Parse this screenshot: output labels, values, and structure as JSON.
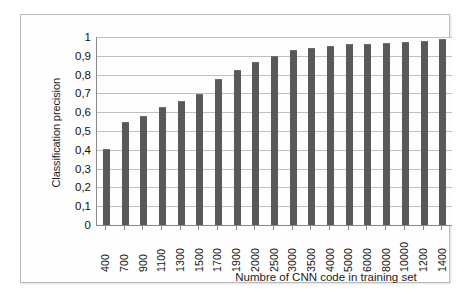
{
  "chart_data": {
    "type": "bar",
    "title": "",
    "xlabel": "Numbre of CNN code in training set",
    "ylabel": "Classification precision",
    "categories": [
      "400",
      "700",
      "900",
      "1100",
      "1300",
      "1500",
      "1700",
      "1900",
      "2000",
      "2500",
      "3000",
      "3500",
      "4000",
      "5000",
      "6000",
      "8000",
      "10000",
      "1200",
      "1400"
    ],
    "values": [
      0.4,
      0.54,
      0.575,
      0.625,
      0.655,
      0.69,
      0.77,
      0.82,
      0.86,
      0.895,
      0.925,
      0.935,
      0.945,
      0.955,
      0.96,
      0.965,
      0.97,
      0.975,
      0.985
    ],
    "ylim": [
      0,
      1
    ],
    "ytick_labels": [
      "0",
      "0,1",
      "0,2",
      "0,3",
      "0,4",
      "0,5",
      "0,6",
      "0,7",
      "0,8",
      "0,9",
      "1"
    ],
    "ytick_values": [
      0,
      0.1,
      0.2,
      0.3,
      0.4,
      0.5,
      0.6,
      0.7,
      0.8,
      0.9,
      1
    ],
    "grid": true,
    "legend": false,
    "bar_color": "#595959",
    "gridline_color": "#c0c0c0",
    "axis_color": "#8a8a8a",
    "plot_background": "#fdfdfd",
    "frame_border_color": "#b9b9b9"
  }
}
